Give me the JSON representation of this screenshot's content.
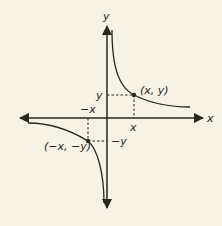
{
  "diagram": {
    "type": "function-graph",
    "colors": {
      "background": "#f6f2e6",
      "ink": "#2a2622"
    },
    "axes": {
      "x_label": "x",
      "y_label": "y"
    },
    "points": [
      {
        "label": "(x, y)",
        "x_tick": "x",
        "y_tick": "y"
      },
      {
        "label": "(−x, −y)",
        "x_tick": "−x",
        "y_tick": "−y"
      }
    ]
  }
}
